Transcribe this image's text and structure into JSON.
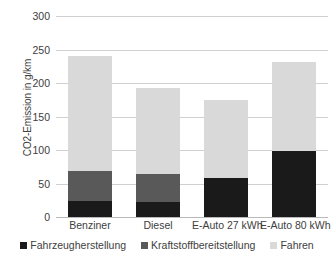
{
  "chart_data": {
    "type": "bar",
    "subtype": "stacked-bar",
    "title": "",
    "xlabel": "",
    "ylabel": "CO2-Emission in g/km",
    "ylim": [
      0,
      300
    ],
    "yticks": [
      0,
      50,
      100,
      150,
      200,
      250,
      300
    ],
    "ytick_labels": [
      "0",
      "50",
      "100",
      "150",
      "200",
      "250",
      "300"
    ],
    "grid": true,
    "legend_position": "bottom",
    "categories": [
      "Benziner",
      "Diesel",
      "E-Auto 27 kWh",
      "E-Auto 80 kWh"
    ],
    "series": [
      {
        "name": "Fahrzeugherstellung",
        "color": "#1a1a1a",
        "values": [
          24,
          23,
          58,
          98
        ]
      },
      {
        "name": "Kraftstoffbereitstellung",
        "color": "#595959",
        "values": [
          45,
          41,
          0,
          0
        ]
      },
      {
        "name": "Fahren",
        "color": "#d9d9d9",
        "values": [
          171,
          129,
          117,
          134
        ]
      }
    ],
    "totals": [
      240,
      193,
      175,
      232
    ]
  },
  "axis": {
    "y_title": "CO2-Emission in g/km",
    "ticks": [
      {
        "label": "300",
        "value": 300
      },
      {
        "label": "250",
        "value": 250
      },
      {
        "label": "200",
        "value": 200
      },
      {
        "label": "150",
        "value": 150
      },
      {
        "label": "100",
        "value": 100
      },
      {
        "label": "50",
        "value": 50
      },
      {
        "label": "0",
        "value": 0
      }
    ]
  },
  "categories": [
    {
      "label": "Benziner"
    },
    {
      "label": "Diesel"
    },
    {
      "label": "E-Auto 27 kWh"
    },
    {
      "label": "E-Auto 80 kWh"
    }
  ],
  "legend": [
    {
      "label": "Fahrzeugherstellung",
      "color": "#1a1a1a"
    },
    {
      "label": "Kraftstoffbereitstellung",
      "color": "#595959"
    },
    {
      "label": "Fahren",
      "color": "#d9d9d9"
    }
  ]
}
